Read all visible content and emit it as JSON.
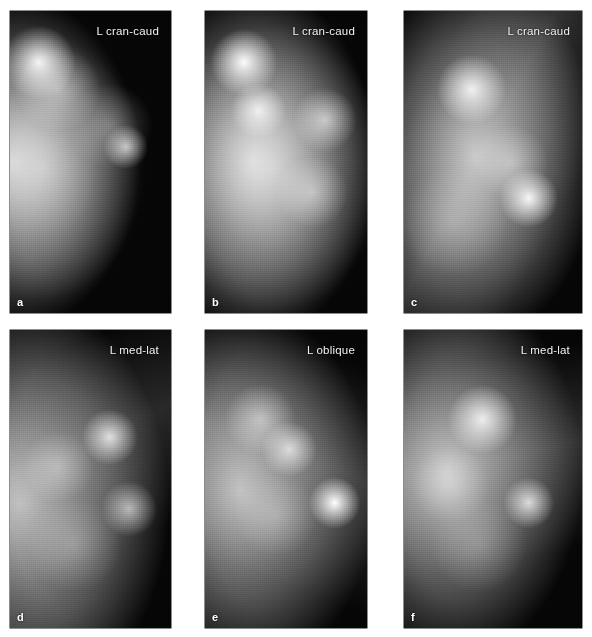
{
  "figure": {
    "background_color": "#ffffff",
    "panel_background_color": "#050505",
    "label_color": "#f2f2f2",
    "rows": 2,
    "columns": 3
  },
  "panels": [
    {
      "id": "a",
      "letter": "a",
      "view_label": "L cran-caud",
      "x": 10,
      "y": 11,
      "width": 161,
      "height": 302
    },
    {
      "id": "b",
      "letter": "b",
      "view_label": "L cran-caud",
      "x": 205,
      "y": 11,
      "width": 162,
      "height": 302
    },
    {
      "id": "c",
      "letter": "c",
      "view_label": "L cran-caud",
      "x": 404,
      "y": 11,
      "width": 178,
      "height": 302
    },
    {
      "id": "d",
      "letter": "d",
      "view_label": "L med-lat",
      "x": 10,
      "y": 330,
      "width": 161,
      "height": 298
    },
    {
      "id": "e",
      "letter": "e",
      "view_label": "L oblique",
      "x": 205,
      "y": 330,
      "width": 162,
      "height": 298
    },
    {
      "id": "f",
      "letter": "f",
      "view_label": "L med-lat",
      "x": 404,
      "y": 330,
      "width": 178,
      "height": 298
    }
  ]
}
